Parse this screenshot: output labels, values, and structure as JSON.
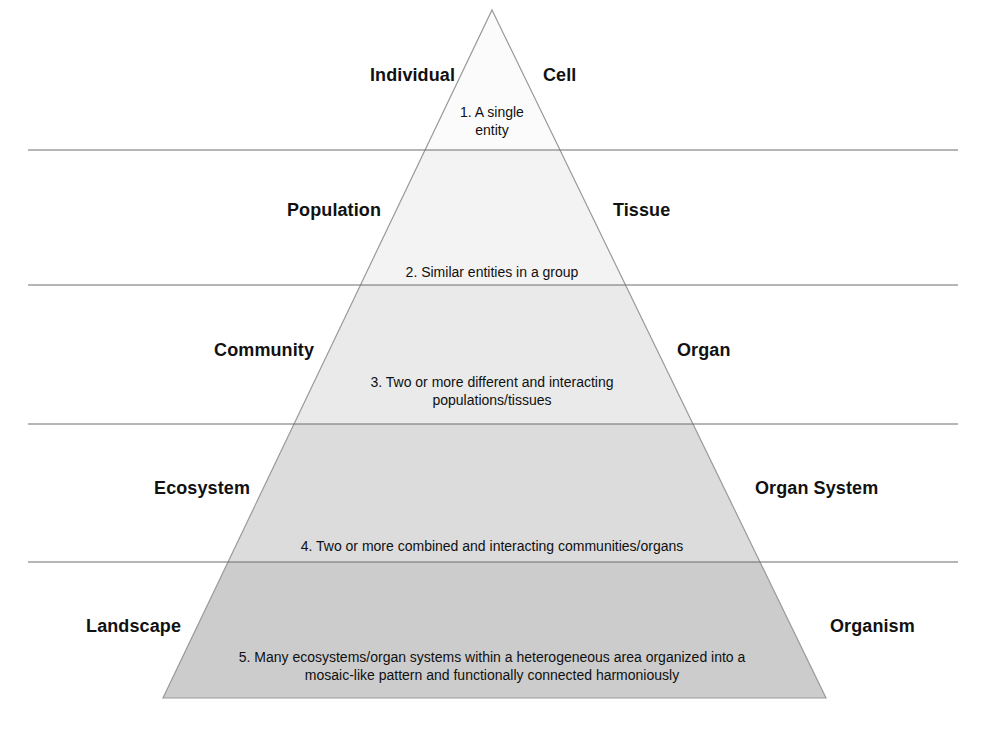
{
  "figure": {
    "kind": "hierarchy-pyramid",
    "apex": {
      "x": 492,
      "y": 10
    },
    "base_left": {
      "x": 163,
      "y": 698
    },
    "base_right": {
      "x": 826,
      "y": 698
    },
    "outline_color": "#9a9a9a",
    "divider_color": "#6d6d6d",
    "background_color": "#ffffff",
    "divider_x_start": 28,
    "divider_x_end": 958,
    "divider_y": [
      150,
      285,
      424,
      562
    ]
  },
  "tiers": [
    {
      "index": "1",
      "left_label": "Individual",
      "right_label": "Cell",
      "description": "1. A single\nentity",
      "fill": "#fbfbfb",
      "label_y": 66,
      "label_left_right_edge": 455,
      "label_right_left_edge": 543,
      "label_font_size": 18,
      "desc_center_x": 492,
      "desc_y": 104,
      "desc_width": 260,
      "desc_font_size": 14
    },
    {
      "index": "2",
      "left_label": "Population",
      "right_label": "Tissue",
      "description": "2. Similar entities in a group",
      "fill": "#f3f3f3",
      "label_y": 201,
      "label_left_right_edge": 381,
      "label_right_left_edge": 613,
      "label_font_size": 18,
      "desc_center_x": 492,
      "desc_y": 264,
      "desc_width": 420,
      "desc_font_size": 14
    },
    {
      "index": "3",
      "left_label": "Community",
      "right_label": "Organ",
      "description": "3. Two or more different and interacting\npopulations/tissues",
      "fill": "#eaeaea",
      "label_y": 341,
      "label_left_right_edge": 314,
      "label_right_left_edge": 677,
      "label_font_size": 18,
      "desc_center_x": 492,
      "desc_y": 374,
      "desc_width": 460,
      "desc_font_size": 14
    },
    {
      "index": "4",
      "left_label": "Ecosystem",
      "right_label": "Organ System",
      "description": "4. Two or more combined and interacting communities/organs",
      "fill": "#dcdcdc",
      "label_y": 479,
      "label_left_right_edge": 250,
      "label_right_left_edge": 755,
      "label_font_size": 18,
      "desc_center_x": 492,
      "desc_y": 538,
      "desc_width": 620,
      "desc_font_size": 14
    },
    {
      "index": "5",
      "left_label": "Landscape",
      "right_label": "Organism",
      "description": "5. Many ecosystems/organ systems within a heterogeneous area organized into a\nmosaic-like pattern and functionally connected harmoniously",
      "fill": "#cccccc",
      "label_y": 617,
      "label_left_right_edge": 181,
      "label_right_left_edge": 830,
      "label_font_size": 18,
      "desc_center_x": 492,
      "desc_y": 649,
      "desc_width": 700,
      "desc_font_size": 14
    }
  ]
}
